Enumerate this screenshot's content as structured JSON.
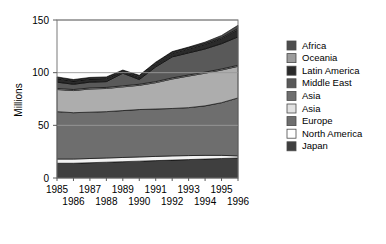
{
  "chart_data": {
    "type": "area",
    "stacked": true,
    "title": "",
    "subtitle": "",
    "xlabel": "",
    "ylabel": "Millions",
    "ylim": [
      0,
      150
    ],
    "yticks": [
      0,
      50,
      100,
      150
    ],
    "ytick_labels": [
      "0",
      "50",
      "100",
      "150"
    ],
    "grid": true,
    "grid_axis": "y",
    "legend_position": "right",
    "x": [
      1985,
      1986,
      1987,
      1988,
      1989,
      1990,
      1991,
      1992,
      1993,
      1994,
      1995,
      1996
    ],
    "xtick_labels": [
      "1985",
      "1986",
      "1987",
      "1988",
      "1989",
      "1990",
      "1991",
      "1992",
      "1993",
      "1994",
      "1995",
      "1996"
    ],
    "xtick_rows": {
      "top": [
        "1985",
        "1987",
        "1989",
        "1991",
        "1993",
        "1995"
      ],
      "bottom": [
        "1986",
        "1988",
        "1990",
        "1992",
        "1994",
        "1996"
      ]
    },
    "series": [
      {
        "name": "Japan",
        "color": "#3f3f3f",
        "values": [
          14.0,
          14.0,
          14.5,
          15.0,
          15.5,
          16.0,
          16.5,
          17.0,
          17.5,
          18.0,
          18.5,
          19.0
        ]
      },
      {
        "name": "North America",
        "color": "#f2f2f2",
        "values": [
          4.0,
          4.0,
          4.0,
          4.0,
          4.0,
          4.0,
          4.0,
          4.0,
          3.8,
          3.5,
          3.0,
          2.0
        ]
      },
      {
        "name": "Europe",
        "color": "#6e6e6e",
        "values": [
          45.0,
          44.0,
          44.0,
          44.0,
          44.5,
          45.0,
          45.0,
          45.0,
          45.5,
          47.0,
          50.0,
          55.0
        ]
      },
      {
        "name": "Asia",
        "color": "#adadad",
        "values": [
          21.0,
          21.0,
          22.0,
          22.0,
          22.5,
          23.0,
          25.0,
          28.0,
          30.0,
          31.0,
          31.0,
          30.0
        ]
      },
      {
        "name": "Asia",
        "color": "#e2e2e2",
        "values": [
          1.0,
          1.0,
          1.0,
          1.0,
          1.0,
          1.0,
          1.0,
          1.0,
          1.0,
          1.0,
          1.0,
          1.0
        ]
      },
      {
        "name": "Middle East",
        "color": "#595959",
        "values": [
          6.0,
          5.0,
          5.5,
          5.5,
          12.0,
          4.5,
          14.0,
          20.0,
          21.0,
          22.0,
          24.0,
          27.0
        ]
      },
      {
        "name": "Latin America",
        "color": "#2a2a2a",
        "values": [
          3.5,
          3.0,
          3.0,
          3.0,
          1.5,
          2.5,
          3.0,
          3.5,
          4.0,
          4.5,
          5.0,
          7.0
        ]
      },
      {
        "name": "Oceania",
        "color": "#9c9c9c",
        "values": [
          0.8,
          0.8,
          0.8,
          0.8,
          0.8,
          0.8,
          0.8,
          0.8,
          0.8,
          0.8,
          0.8,
          1.0
        ]
      },
      {
        "name": "Africa",
        "color": "#4d4d4d",
        "values": [
          0.7,
          0.7,
          0.7,
          0.7,
          0.7,
          0.7,
          0.7,
          0.7,
          0.7,
          1.2,
          2.0,
          3.0
        ]
      }
    ],
    "legend_order_top_to_bottom": [
      "Africa",
      "Oceania",
      "Latin America",
      "Middle East",
      "Asia",
      "Asia",
      "Europe",
      "North America",
      "Japan"
    ]
  },
  "axes": {
    "y_axis_title": "Millions"
  },
  "legend": {
    "items": [
      {
        "label": "Africa",
        "color": "#4d4d4d"
      },
      {
        "label": "Oceania",
        "color": "#9c9c9c"
      },
      {
        "label": "Latin America",
        "color": "#2a2a2a"
      },
      {
        "label": "Middle East",
        "color": "#595959"
      },
      {
        "label": "Asia",
        "color": "#6e6e6e"
      },
      {
        "label": "Asia",
        "color": "#e2e2e2"
      },
      {
        "label": "Europe",
        "color": "#6e6e6e"
      },
      {
        "label": "North America",
        "color": "#ffffff"
      },
      {
        "label": "Japan",
        "color": "#3f3f3f"
      }
    ]
  }
}
